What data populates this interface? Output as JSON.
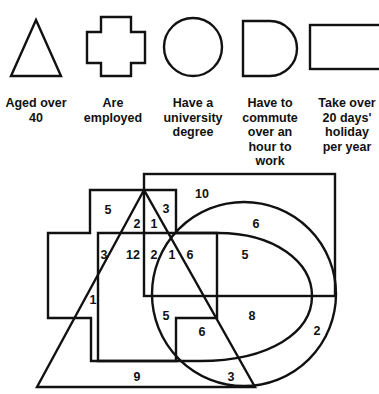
{
  "legend": [
    {
      "shape": "triangle",
      "icon": "triangle-icon",
      "lines": [
        "Aged over",
        "40"
      ],
      "x": 36
    },
    {
      "shape": "cross",
      "icon": "cross-icon",
      "lines": [
        "Are",
        "employed"
      ],
      "x": 113
    },
    {
      "shape": "circle",
      "icon": "circle-icon",
      "lines": [
        "Have a",
        "university",
        "degree"
      ],
      "x": 193
    },
    {
      "shape": "d-shape",
      "icon": "d-shape-icon",
      "lines": [
        "Have to",
        "commute",
        "over an",
        "hour to",
        "work"
      ],
      "x": 270
    },
    {
      "shape": "rectangle",
      "icon": "rectangle-icon",
      "lines": [
        "Take over",
        "20 days'",
        "holiday",
        "per year"
      ],
      "x": 347
    }
  ],
  "regions": [
    {
      "value": "5",
      "x": 108,
      "y": 210
    },
    {
      "value": "2",
      "x": 137,
      "y": 224
    },
    {
      "value": "1",
      "x": 154,
      "y": 224
    },
    {
      "value": "3",
      "x": 166,
      "y": 209
    },
    {
      "value": "10",
      "x": 202,
      "y": 194
    },
    {
      "value": "6",
      "x": 256,
      "y": 224
    },
    {
      "value": "3",
      "x": 104,
      "y": 255
    },
    {
      "value": "12",
      "x": 133,
      "y": 255
    },
    {
      "value": "2",
      "x": 154,
      "y": 255
    },
    {
      "value": "1",
      "x": 172,
      "y": 255
    },
    {
      "value": "6",
      "x": 190,
      "y": 255
    },
    {
      "value": "5",
      "x": 245,
      "y": 255
    },
    {
      "value": "1",
      "x": 93,
      "y": 300
    },
    {
      "value": "5",
      "x": 166,
      "y": 316
    },
    {
      "value": "8",
      "x": 252,
      "y": 316
    },
    {
      "value": "6",
      "x": 202,
      "y": 332
    },
    {
      "value": "2",
      "x": 317,
      "y": 331
    },
    {
      "value": "9",
      "x": 137,
      "y": 377
    },
    {
      "value": "3",
      "x": 231,
      "y": 377
    }
  ],
  "colors": {
    "stroke": "#111111",
    "background": "#ffffff"
  }
}
